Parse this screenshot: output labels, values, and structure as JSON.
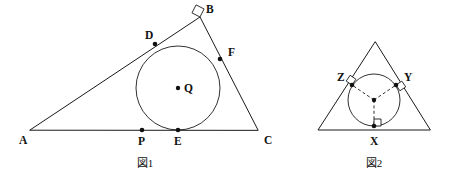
{
  "canvas": {
    "width": 450,
    "height": 182,
    "background": "#ffffff",
    "ink": "#1a1a1a"
  },
  "figure1": {
    "caption": "図1",
    "caption_pos": {
      "x": 145,
      "y": 167
    },
    "triangle": {
      "name": "triangle-ABC",
      "vertices": [
        {
          "label": "A",
          "x": 30,
          "y": 130,
          "label_x": 19,
          "label_y": 141,
          "dot": false
        },
        {
          "label": "B",
          "x": 200,
          "y": 17,
          "label_x": 206,
          "label_y": 10,
          "dot": false
        },
        {
          "label": "C",
          "x": 258,
          "y": 130,
          "label_x": 264,
          "label_y": 141,
          "dot": false
        }
      ]
    },
    "circle": {
      "name": "incircle-Q",
      "cx": 178,
      "cy": 88,
      "r": 42
    },
    "center": {
      "label": "Q",
      "x": 178,
      "y": 88,
      "label_x": 184,
      "label_y": 89,
      "dot": true
    },
    "tangent_points": [
      {
        "label": "D",
        "x": 155,
        "y": 44,
        "label_x": 145,
        "label_y": 36,
        "dot": true
      },
      {
        "label": "F",
        "x": 220,
        "y": 59,
        "label_x": 228,
        "label_y": 53,
        "dot": true
      },
      {
        "label": "E",
        "x": 178,
        "y": 130,
        "label_x": 174,
        "label_y": 142,
        "dot": true
      },
      {
        "label": "P",
        "x": 142,
        "y": 130,
        "label_x": 138,
        "label_y": 142,
        "dot": true
      }
    ],
    "right_angle": {
      "at": "B",
      "x": 200,
      "y": 17,
      "size": 9,
      "rotation_deg": 207
    }
  },
  "figure2": {
    "caption": "図2",
    "caption_pos": {
      "x": 374,
      "y": 167
    },
    "triangle": {
      "name": "triangle-outer",
      "vertices": [
        {
          "label": "",
          "x": 375,
          "y": 42
        },
        {
          "label": "",
          "x": 318,
          "y": 130
        },
        {
          "label": "",
          "x": 430,
          "y": 130
        }
      ]
    },
    "circle": {
      "name": "incircle-2",
      "cx": 374,
      "cy": 100,
      "r": 26
    },
    "center": {
      "label": "",
      "x": 374,
      "y": 100,
      "dot": true
    },
    "tangent_points": [
      {
        "label": "Z",
        "x": 352,
        "y": 85,
        "label_x": 337,
        "label_y": 78,
        "dot": true
      },
      {
        "label": "Y",
        "x": 396,
        "y": 85,
        "label_x": 404,
        "label_y": 78,
        "dot": true
      },
      {
        "label": "X",
        "x": 374,
        "y": 126,
        "label_x": 370,
        "label_y": 142,
        "dot": true
      }
    ],
    "radii_dashed": [
      {
        "name": "radius-to-Z",
        "x1": 374,
        "y1": 100,
        "x2": 352,
        "y2": 85
      },
      {
        "name": "radius-to-Y",
        "x1": 374,
        "y1": 100,
        "x2": 396,
        "y2": 85
      },
      {
        "name": "radius-to-X",
        "x1": 374,
        "y1": 100,
        "x2": 374,
        "y2": 126
      }
    ],
    "right_angles": [
      {
        "at": "Z",
        "x": 352,
        "y": 85,
        "size": 7,
        "rotation_deg": 214
      },
      {
        "at": "Y",
        "x": 396,
        "y": 85,
        "size": 7,
        "rotation_deg": 326
      },
      {
        "at": "X",
        "x": 374,
        "y": 126,
        "size": 7,
        "rotation_deg": 270
      }
    ]
  }
}
